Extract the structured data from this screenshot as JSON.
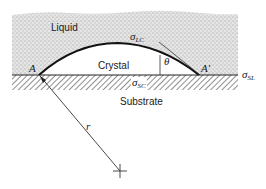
{
  "diagram": {
    "regions": {
      "liquid": "Liquid",
      "crystal": "Crystal",
      "substrate": "Substrate"
    },
    "points": {
      "left_contact": "A",
      "right_contact": "A′"
    },
    "tensions": {
      "liquid_crystal": {
        "symbol": "σ",
        "subscript": "LC"
      },
      "substrate_liquid": {
        "symbol": "σ",
        "subscript": "SL"
      },
      "substrate_crystal": {
        "symbol": "σ",
        "subscript": "SC"
      }
    },
    "angle": "θ",
    "radius": "r",
    "colors": {
      "ink": "#1a1a1a",
      "stipple": "#c8c8c8",
      "background": "#ffffff"
    }
  }
}
